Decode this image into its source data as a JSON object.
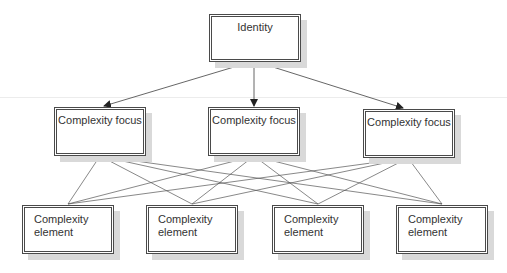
{
  "diagram": {
    "type": "hierarchy",
    "levels": [
      {
        "name": "identity-level",
        "nodes": [
          {
            "label": "Identity"
          }
        ]
      },
      {
        "name": "focus-level",
        "nodes": [
          {
            "label": "Complexity focus"
          },
          {
            "label": "Complexity focus"
          },
          {
            "label": "Complexity focus"
          }
        ]
      },
      {
        "name": "element-level",
        "nodes": [
          {
            "label": "Complexity\nelement"
          },
          {
            "label": "Complexity\nelement"
          },
          {
            "label": "Complexity\nelement"
          },
          {
            "label": "Complexity\nelement"
          }
        ]
      }
    ],
    "edges": {
      "identity_to_focus": "directed arrows from Identity to each Complexity focus",
      "focus_to_element": "undirected lines fully connecting each Complexity focus to every Complexity element"
    },
    "colors": {
      "line": "#555555",
      "border": "#4a4a4a",
      "shadow": "#d9d9d9",
      "text": "#333333"
    }
  }
}
